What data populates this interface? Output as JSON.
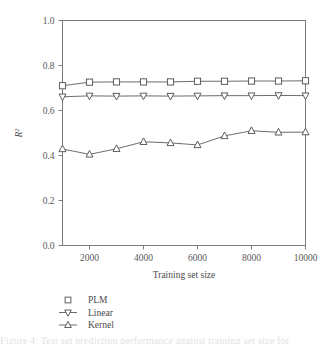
{
  "chart_data": {
    "type": "line",
    "title": "",
    "xlabel": "Training set size",
    "ylabel": "R²",
    "xlim": [
      1000,
      10000
    ],
    "ylim": [
      0.0,
      1.0
    ],
    "xticks": [
      2000,
      4000,
      6000,
      8000,
      10000
    ],
    "xtick_labels": [
      "2000",
      "4000",
      "6000",
      "8000",
      "10000"
    ],
    "yticks": [
      0.0,
      0.2,
      0.4,
      0.6,
      0.8,
      1.0
    ],
    "ytick_labels": [
      "0.0",
      "0.2",
      "0.4",
      "0.6",
      "0.8",
      "1.0"
    ],
    "x": [
      1000,
      2000,
      3000,
      4000,
      5000,
      6000,
      7000,
      8000,
      9000,
      10000
    ],
    "grid": false,
    "legend_position": "below-axes-left",
    "series": [
      {
        "name": "PLM",
        "marker": "square",
        "values": [
          0.71,
          0.726,
          0.727,
          0.727,
          0.727,
          0.73,
          0.73,
          0.731,
          0.731,
          0.732
        ]
      },
      {
        "name": "Linear",
        "marker": "triangle-down",
        "values": [
          0.661,
          0.665,
          0.664,
          0.665,
          0.664,
          0.665,
          0.666,
          0.666,
          0.667,
          0.666
        ]
      },
      {
        "name": "Kernel",
        "marker": "triangle-up",
        "values": [
          0.429,
          0.405,
          0.43,
          0.461,
          0.456,
          0.447,
          0.487,
          0.51,
          0.503,
          0.504
        ]
      }
    ]
  },
  "legend": {
    "items": [
      {
        "label": "PLM",
        "marker": "square",
        "has_line": false
      },
      {
        "label": "Linear",
        "marker": "triangle-down",
        "has_line": true
      },
      {
        "label": "Kernel",
        "marker": "triangle-up",
        "has_line": true
      }
    ]
  },
  "caption": {
    "ghost_text": "Figure 4: Test set prediction performance against training set size for"
  },
  "colors": {
    "axis": "#6e6e70",
    "line": "#5b5b5d",
    "marker_fill": "#ffffff",
    "marker_stroke": "#4d4d4f",
    "text": "#4a4a4c",
    "background": "#ffffff"
  }
}
